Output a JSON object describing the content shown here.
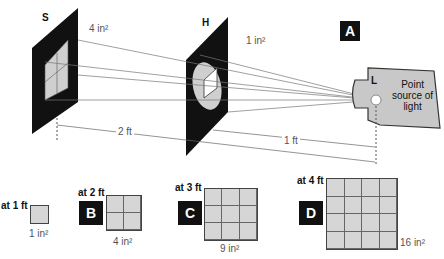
{
  "figure": {
    "panel_label": "A",
    "screen_s": {
      "label": "S",
      "area": "4 in²"
    },
    "screen_h": {
      "label": "H",
      "area": "1 in²"
    },
    "source": {
      "label": "L",
      "caption_line1": "Point",
      "caption_line2": "source of",
      "caption_line3": "light"
    },
    "distances": {
      "far": "2 ft",
      "near": "1 ft"
    }
  },
  "squares": [
    {
      "distance": "at 1 ft",
      "badge": "",
      "area": "1 in²",
      "n": 1
    },
    {
      "distance": "at 2 ft",
      "badge": "B",
      "area": "4 in²",
      "n": 2
    },
    {
      "distance": "at 3 ft",
      "badge": "C",
      "area": "9 in²",
      "n": 3
    },
    {
      "distance": "at 4 ft",
      "badge": "D",
      "area": "16 in²",
      "n": 4
    }
  ],
  "colors": {
    "panel": "#111111",
    "fill": "#d6d6d6",
    "source": "#c8c8c8"
  }
}
